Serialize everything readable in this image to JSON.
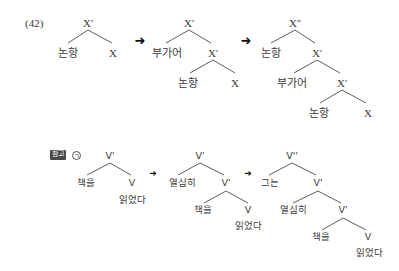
{
  "example_number": "(42)",
  "top": {
    "tree1": {
      "root": "X'",
      "left": "논항",
      "right": "X"
    },
    "tree2": {
      "root": "X'",
      "left": "부가어",
      "mid": "X'",
      "mid_left": "논항",
      "mid_right": "X"
    },
    "tree3": {
      "root": "X''",
      "left": "논항",
      "mid": "X'",
      "mid_left": "부가어",
      "mid2": "X'",
      "low_left": "논항",
      "low_right": "X"
    },
    "arrow": "➜"
  },
  "bottom": {
    "ref_label": "참고",
    "marker": "ㄱ",
    "tree1": {
      "root": "V'",
      "left": "책을",
      "right": "V",
      "verb": "읽었다"
    },
    "tree2": {
      "root": "V'",
      "left": "열심히",
      "mid": "V'",
      "mid_left": "책을",
      "mid_right": "V",
      "verb": "읽었다"
    },
    "tree3": {
      "root": "V''",
      "left": "그는",
      "mid": "V'",
      "mid_left": "열심히",
      "mid2": "V'",
      "low_left": "책을",
      "low_right": "V",
      "verb": "읽었다"
    },
    "arrow": "➜"
  }
}
